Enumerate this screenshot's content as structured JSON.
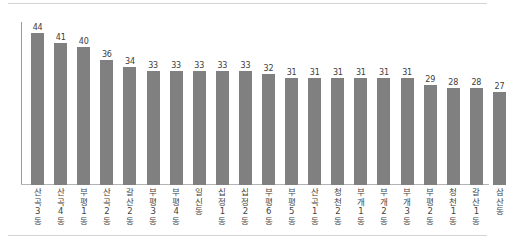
{
  "chart_data": {
    "type": "bar",
    "title": "",
    "subtitle": "",
    "xlabel": "",
    "ylabel": "",
    "ylim": [
      0,
      48
    ],
    "grid": false,
    "legend": null,
    "orientation": "vertical",
    "bar_color": "#808080",
    "value_label_color": "#3d3d3d",
    "axis_color": "#b4b4b4",
    "categories": [
      "산곡3동",
      "산곡4동",
      "부평1동",
      "산곡2동",
      "갈산2동",
      "부평3동",
      "부평4동",
      "일신동",
      "십정1동",
      "십정2동",
      "부평6동",
      "부평5동",
      "산곡1동",
      "청천2동",
      "부개1동",
      "부개2동",
      "부개3동",
      "부평2동",
      "청천1동",
      "갈산1동",
      "삼산동"
    ],
    "values": [
      44,
      41,
      40,
      36,
      34,
      33,
      33,
      33,
      33,
      33,
      32,
      31,
      31,
      31,
      31,
      31,
      31,
      29,
      28,
      28,
      27
    ],
    "value_labels": [
      "44",
      "41",
      "40",
      "36",
      "34",
      "33",
      "33",
      "33",
      "33",
      "33",
      "32",
      "31",
      "31",
      "31",
      "31",
      "31",
      "31",
      "29",
      "28",
      "28",
      "27"
    ]
  }
}
